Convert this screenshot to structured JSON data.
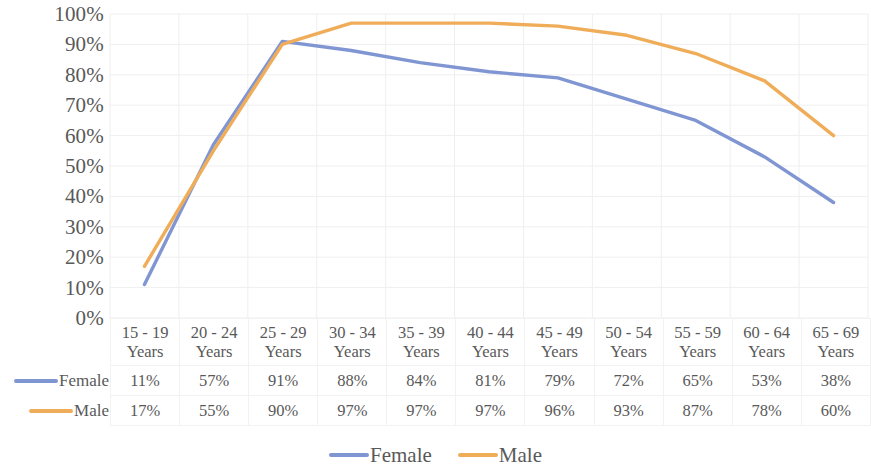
{
  "chart_data": {
    "type": "line",
    "title": "",
    "subtitle": "",
    "xlabel": "",
    "ylabel": "",
    "ylim": [
      0,
      100
    ],
    "yticks": [
      "0%",
      "10%",
      "20%",
      "30%",
      "40%",
      "50%",
      "60%",
      "70%",
      "80%",
      "90%",
      "100%"
    ],
    "grid": true,
    "legend_position": "bottom-center",
    "has_data_table": true,
    "categories": [
      "15 - 19\nYears",
      "20 - 24\nYears",
      "25 - 29\nYears",
      "30 - 34\nYears",
      "35 - 39\nYears",
      "40 - 44\nYears",
      "45 - 49\nYears",
      "50 - 54\nYears",
      "55 - 59\nYears",
      "60 - 64\nYears",
      "65 - 69\nYears"
    ],
    "series": [
      {
        "name": "Female",
        "color": "#8096D3",
        "values": [
          11,
          57,
          91,
          88,
          84,
          81,
          79,
          72,
          65,
          53,
          38
        ],
        "labels": [
          "11%",
          "57%",
          "91%",
          "88%",
          "84%",
          "81%",
          "79%",
          "72%",
          "65%",
          "53%",
          "38%"
        ]
      },
      {
        "name": "Male",
        "color": "#F0AD59",
        "values": [
          17,
          55,
          90,
          97,
          97,
          97,
          96,
          93,
          87,
          78,
          60
        ],
        "labels": [
          "17%",
          "55%",
          "90%",
          "97%",
          "97%",
          "97%",
          "96%",
          "93%",
          "87%",
          "78%",
          "60%"
        ]
      }
    ]
  },
  "legend": {
    "items": [
      {
        "label": "Female",
        "color": "#8096D3"
      },
      {
        "label": "Male",
        "color": "#F0AD59"
      }
    ]
  },
  "colors": {
    "female": "#8096D3",
    "male": "#F0AD59",
    "text": "#595959",
    "gridline": "#EFEFEF",
    "table_border": "#F2F2F2",
    "background": "#FFFFFF"
  }
}
